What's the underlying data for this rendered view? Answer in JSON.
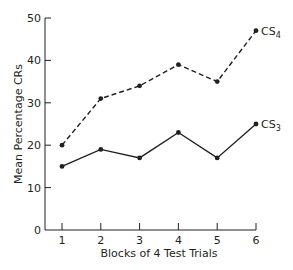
{
  "chart_data": {
    "type": "line",
    "title": "",
    "xlabel": "Blocks of 4 Test Trials",
    "ylabel": "Mean Percentage CRs",
    "x": [
      1,
      2,
      3,
      4,
      5,
      6
    ],
    "categories": [
      "1",
      "2",
      "3",
      "4",
      "5",
      "6"
    ],
    "yticks": [
      "0",
      "10",
      "20",
      "30",
      "40",
      "50"
    ],
    "ylim": [
      0,
      50
    ],
    "grid": false,
    "legend_position": "inline-right",
    "series": [
      {
        "name": "CS4",
        "label_base": "CS",
        "label_sub": "4",
        "style": "dashed",
        "values": [
          20,
          31,
          34,
          39,
          35,
          47
        ]
      },
      {
        "name": "CS3",
        "label_base": "CS",
        "label_sub": "3",
        "style": "solid",
        "values": [
          15,
          19,
          17,
          23,
          17,
          25
        ]
      }
    ]
  }
}
